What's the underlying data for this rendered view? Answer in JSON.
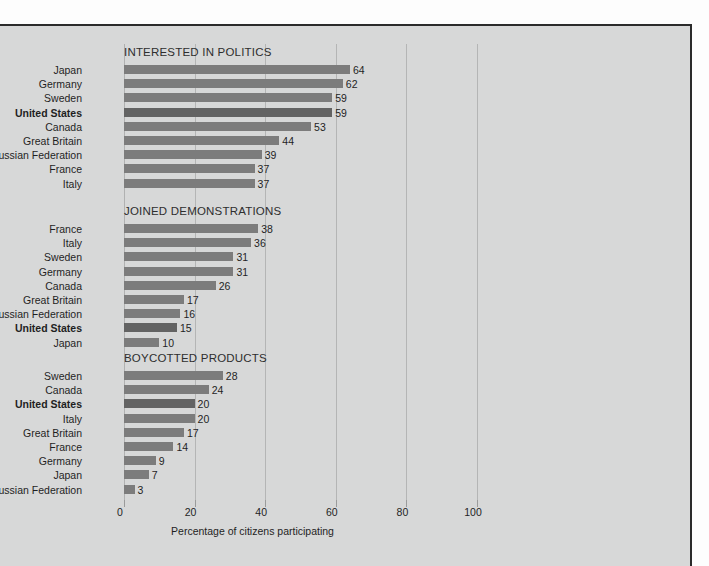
{
  "axis": {
    "title": "Percentage of citizens participating",
    "ticks": [
      0,
      20,
      40,
      60,
      80,
      100
    ],
    "min": 0,
    "max": 100
  },
  "source_note": "",
  "chart_data": {
    "type": "bar",
    "title": "",
    "xlabel": "Percentage of citizens participating",
    "ylabel": "",
    "xlim": [
      0,
      100
    ],
    "grid": true,
    "legend": null,
    "orientation": "horizontal",
    "highlighted_category": "United States",
    "panels": [
      {
        "title": "INTERESTED IN POLITICS",
        "categories": [
          "Japan",
          "Germany",
          "Sweden",
          "United States",
          "Canada",
          "Great Britain",
          "Russian Federation",
          "France",
          "Italy"
        ],
        "values": [
          64,
          62,
          59,
          59,
          53,
          44,
          39,
          37,
          37
        ]
      },
      {
        "title": "JOINED DEMONSTRATIONS",
        "categories": [
          "France",
          "Italy",
          "Sweden",
          "Germany",
          "Canada",
          "Great Britain",
          "Russian Federation",
          "United States",
          "Japan"
        ],
        "values": [
          38,
          36,
          31,
          31,
          26,
          17,
          16,
          15,
          10
        ]
      },
      {
        "title": "BOYCOTTED PRODUCTS",
        "categories": [
          "Sweden",
          "Canada",
          "United States",
          "Italy",
          "Great Britain",
          "France",
          "Germany",
          "Japan",
          "Russian Federation"
        ],
        "values": [
          28,
          24,
          20,
          20,
          17,
          14,
          9,
          7,
          3
        ]
      }
    ]
  },
  "colors": {
    "background": "#d7d8d8",
    "bar": "#7c7c7c",
    "bar_highlight": "#636363",
    "gridline": "#b4b5b5",
    "text": "#1f1f1f",
    "rule": "#2b2b2b"
  }
}
